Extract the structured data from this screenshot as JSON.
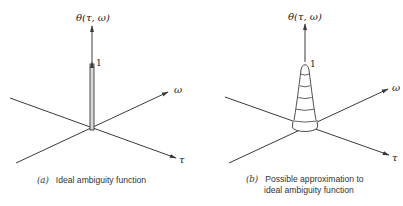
{
  "figure": {
    "panels": [
      {
        "id": "a",
        "vertical_axis_label": "θ(τ, ω)",
        "peak_label": "1",
        "omega_axis_label": "ω",
        "tau_axis_label": "τ",
        "shape": "ideal-spike",
        "caption_tag": "(a)",
        "caption_lines": [
          "Ideal ambiguity function"
        ]
      },
      {
        "id": "b",
        "vertical_axis_label": "θ(τ, ω)",
        "peak_label": "1",
        "omega_axis_label": "ω",
        "tau_axis_label": "τ",
        "shape": "contoured-cone",
        "contour_bands": 5,
        "caption_tag": "(b)",
        "caption_lines": [
          "Possible approximation to",
          "ideal ambiguity function"
        ]
      }
    ],
    "colors": {
      "line": "#3a3a3a",
      "spike_fill": "#d9d9d9",
      "background": "#ffffff"
    }
  }
}
